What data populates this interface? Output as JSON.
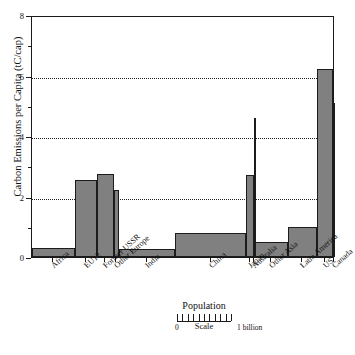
{
  "chart_data": {
    "type": "bar",
    "title": "",
    "subtitle": "",
    "xlabel": "Population",
    "ylabel": "Carbon Emissions per Capita (tC/cap)",
    "ylim": [
      0,
      8
    ],
    "yticks": [
      0,
      2,
      4,
      6,
      8
    ],
    "ytick_labels": [
      "0",
      "2",
      "4",
      "6",
      "8"
    ],
    "yminor_ticks": [
      1,
      3,
      5,
      7
    ],
    "grid": "horizontal dotted at 2, 4, 6",
    "legend": "none",
    "note": "Variable-width (Marimekko) bar chart: bar width is proportional to population, bar height is carbon emissions per capita.",
    "categories": [
      "Africa",
      "EU12",
      "Former USSR",
      "Other Europe",
      "India",
      "China",
      "Japan",
      "Australia",
      "Other Asia",
      "Latin America",
      "US",
      "Canada"
    ],
    "values": [
      0.3,
      2.55,
      2.75,
      2.2,
      0.25,
      0.8,
      2.7,
      4.6,
      0.5,
      1.0,
      6.2,
      5.1
    ],
    "widths_population_billions": [
      0.72,
      0.37,
      0.29,
      0.09,
      0.95,
      1.2,
      0.125,
      0.02,
      0.55,
      0.5,
      0.27,
      0.03
    ],
    "series": [
      {
        "name": "Carbon Emissions per Capita",
        "values": [
          0.3,
          2.55,
          2.75,
          2.2,
          0.25,
          0.8,
          2.7,
          4.6,
          0.5,
          1.0,
          6.2,
          5.1
        ]
      }
    ],
    "bar_color": "#808080",
    "bar_edge_color": "#1c1c1c"
  },
  "scale_legend": {
    "title": "Population",
    "zero_label": "0",
    "one_label": "1 billion",
    "caption": "Scale",
    "ticks": 11
  },
  "caption": ""
}
